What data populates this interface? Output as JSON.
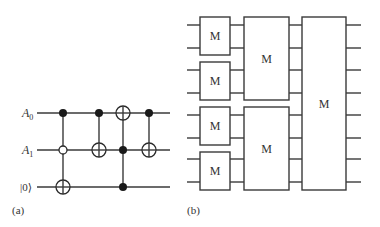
{
  "panels": {
    "a": {
      "caption": "(a)",
      "qubits": [
        {
          "label": "A",
          "sub": "0",
          "y": 113
        },
        {
          "label": "A",
          "sub": "1",
          "y": 150
        },
        {
          "label": "|0⟩",
          "sub": "",
          "y": 187
        }
      ],
      "gates": [
        {
          "x": 63,
          "controls": [
            {
              "qubit": 0,
              "type": "closed"
            },
            {
              "qubit": 1,
              "type": "open"
            }
          ],
          "target": 2
        },
        {
          "x": 99,
          "controls": [
            {
              "qubit": 0,
              "type": "closed"
            }
          ],
          "target": 1
        },
        {
          "x": 123,
          "controls": [
            {
              "qubit": 1,
              "type": "closed"
            },
            {
              "qubit": 2,
              "type": "closed"
            }
          ],
          "target": 0
        },
        {
          "x": 149,
          "controls": [
            {
              "qubit": 0,
              "type": "closed"
            }
          ],
          "target": 1
        }
      ]
    },
    "b": {
      "caption": "(b)",
      "block_label": "M",
      "wire_ys": [
        25,
        48,
        70,
        93,
        115,
        138,
        159,
        182
      ],
      "stages": [
        {
          "boxes": [
            {
              "label": "M",
              "top": 17,
              "bottom": 55
            },
            {
              "label": "M",
              "top": 62,
              "bottom": 100
            },
            {
              "label": "M",
              "top": 107,
              "bottom": 145
            },
            {
              "label": "M",
              "top": 152,
              "bottom": 190
            }
          ]
        },
        {
          "boxes": [
            {
              "label": "M",
              "top": 17,
              "bottom": 100
            },
            {
              "label": "M",
              "top": 107,
              "bottom": 190
            }
          ]
        },
        {
          "boxes": [
            {
              "label": "M",
              "top": 17,
              "bottom": 190
            }
          ]
        }
      ]
    }
  }
}
